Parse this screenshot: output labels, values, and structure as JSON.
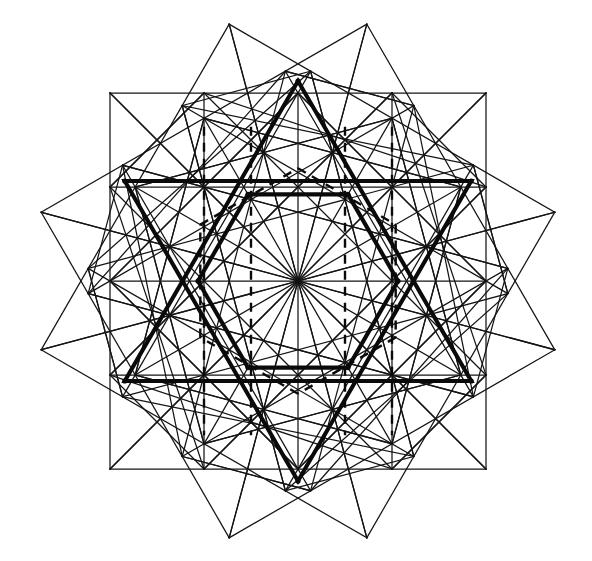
{
  "figure": {
    "background_color": "#ffffff",
    "line_color": "#141414",
    "bold_line_color": "#0a0a0a",
    "canvas": {
      "width": 592,
      "height": 561
    },
    "center": {
      "x": 298,
      "y": 281
    },
    "star_points": 12,
    "lattice_count": 3,
    "lattice_divisions": 4,
    "lattice_half_size": 188,
    "lattice_rotations_deg": [
      0,
      60,
      120
    ],
    "outer_extents": {
      "top_apex": {
        "x": 297,
        "y": 14
      },
      "bottom_apex": {
        "x": 297,
        "y": 548
      },
      "left_apex": {
        "x": 15,
        "y": 281
      },
      "right_apex": {
        "x": 582,
        "y": 281
      }
    },
    "grid_bounds_axis_aligned": {
      "left": 111,
      "top": 122,
      "right": 487,
      "bottom": 441
    },
    "stroke_widths": {
      "thin": 1.25,
      "bold": 4.1,
      "dashed": 2.4
    },
    "dash_pattern": "9 7",
    "bold_overlay": "hexagram",
    "bold_hexagram_radius": 200,
    "dashed_overlay": "inner hexagon and verticals",
    "node_radius": 2.6
  }
}
